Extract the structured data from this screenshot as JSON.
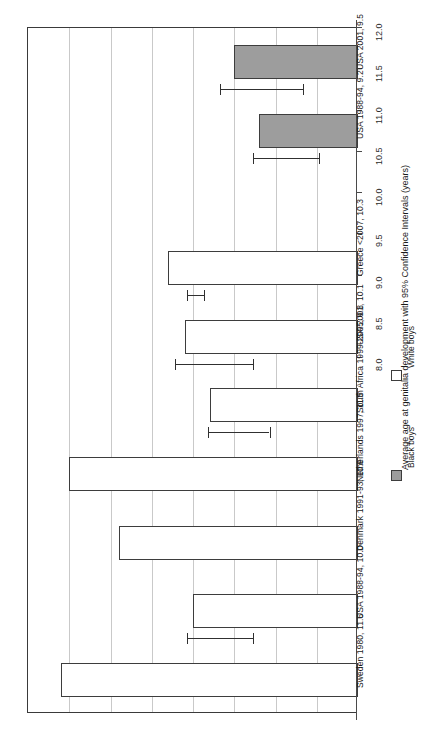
{
  "chart_data": {
    "type": "bar",
    "orientation": "horizontal",
    "title": "",
    "xlabel": "",
    "ylabel": "Average age at genitalia development with 95% Confidence Intervals (years)",
    "axis_title": "Average age at genitalia development with 95% Confidence Intervals (years)",
    "ylim": [
      8.0,
      12.0
    ],
    "axis_range": [
      8.0,
      12.0
    ],
    "tick_step": 0.5,
    "tick_labels": [
      "8.0",
      "8.5",
      "9.0",
      "9.5",
      "10.0",
      "10.5",
      "11.0",
      "11.5",
      "12.0"
    ],
    "tick_values": [
      8.0,
      8.5,
      9.0,
      9.5,
      10.0,
      10.5,
      11.0,
      11.5,
      12.0
    ],
    "grid": true,
    "legend_position": "right",
    "series": [
      {
        "name": "Black boys",
        "color": "#9d9d9d",
        "fill": "gray"
      },
      {
        "name": "White boys",
        "color": "#ffffff",
        "fill": "white"
      }
    ],
    "categories": [
      "USA 2001, 9.5",
      "USA 1988-94, 9.2",
      "",
      "Greece <2007, 10.3",
      "USA 2001, 10.1",
      "South Africa 1999-2005, 9.8",
      "Netherlands 1997, 11.5",
      "Denmark 1991-93, 10.9",
      "USA 1988-94, 10.0",
      "Sweden 1980, 11.6"
    ],
    "points": [
      {
        "label": "USA 2001, 9.5",
        "group": "Black boys",
        "value": 9.5,
        "ci_low": 9.0,
        "ci_high": 10.0
      },
      {
        "label": "USA 1988-94, 9.2",
        "group": "Black boys",
        "value": 9.2,
        "ci_low": 8.8,
        "ci_high": 9.6
      },
      {
        "label": "Greece <2007, 10.3",
        "group": "White boys",
        "value": 10.3,
        "ci_low": 10.2,
        "ci_high": 10.4
      },
      {
        "label": "USA 2001, 10.1",
        "group": "White boys",
        "value": 10.1,
        "ci_low": 9.6,
        "ci_high": 10.55
      },
      {
        "label": "South Africa 1999-2005, 9.8",
        "group": "White boys",
        "value": 9.8,
        "ci_low": 9.4,
        "ci_high": 10.15
      },
      {
        "label": "Netherlands 1997, 11.5",
        "group": "White boys",
        "value": 11.5,
        "ci_low": null,
        "ci_high": null
      },
      {
        "label": "Denmark 1991-93, 10.9",
        "group": "White boys",
        "value": 10.9,
        "ci_low": null,
        "ci_high": null
      },
      {
        "label": "USA 1988-94, 10.0",
        "group": "White boys",
        "value": 10.0,
        "ci_low": 9.6,
        "ci_high": 10.4
      },
      {
        "label": "Sweden 1980, 11.6",
        "group": "White boys",
        "value": 11.6,
        "ci_low": null,
        "ci_high": null
      }
    ]
  },
  "legend": {
    "items": [
      {
        "label": "Black boys",
        "swatch": "filled"
      },
      {
        "label": "White boys",
        "swatch": "hollow"
      }
    ]
  }
}
